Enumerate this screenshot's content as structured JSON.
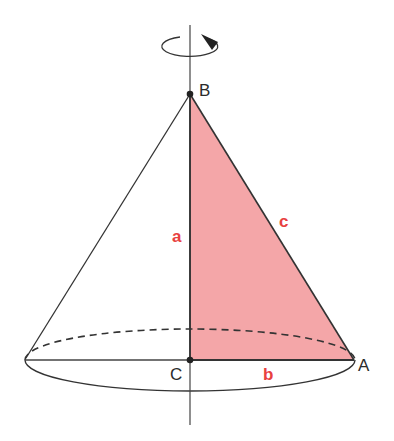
{
  "diagram": {
    "points": {
      "B": {
        "label": "B",
        "x": 190,
        "y": 94
      },
      "C": {
        "label": "C",
        "x": 190,
        "y": 360
      },
      "A": {
        "label": "A",
        "x": 354,
        "y": 360
      }
    },
    "sides": {
      "a": {
        "label": "a"
      },
      "b": {
        "label": "b"
      },
      "c": {
        "label": "c"
      }
    },
    "base_ellipse": {
      "cx": 190,
      "cy": 361,
      "rx": 165,
      "ry": 31
    },
    "colors": {
      "triangle_fill": "#f4a6a8",
      "side_label": "#e8413f",
      "stroke": "#2b2b2b"
    },
    "rotation_indicator": "rotation-arrow"
  }
}
